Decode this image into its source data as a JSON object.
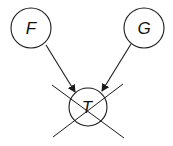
{
  "diagram": {
    "type": "directed-graph",
    "nodes": [
      {
        "id": "F",
        "label": "F",
        "cx": 31,
        "cy": 28,
        "r": 20
      },
      {
        "id": "G",
        "label": "G",
        "cx": 144,
        "cy": 28,
        "r": 20
      },
      {
        "id": "T",
        "label": "T",
        "cx": 88,
        "cy": 107,
        "r": 19,
        "crossed_out": true
      }
    ],
    "edges": [
      {
        "from": "F",
        "to": "T"
      },
      {
        "from": "G",
        "to": "T"
      }
    ],
    "colors": {
      "stroke": "#1a1a1a",
      "background": "#ffffff"
    }
  }
}
